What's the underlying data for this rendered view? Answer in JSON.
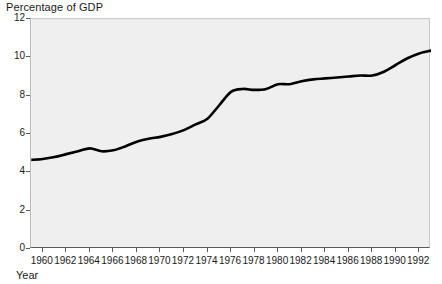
{
  "chart_data": {
    "type": "line",
    "title": "Percentage of GDP",
    "xlabel": "Year",
    "ylabel": "",
    "xlim": [
      1959,
      1993
    ],
    "ylim": [
      0,
      12
    ],
    "grid": false,
    "legend": "none",
    "y_ticks": [
      0,
      2,
      4,
      6,
      8,
      10,
      12
    ],
    "y_tick_labels": [
      "0",
      "2",
      "4",
      "6",
      "8",
      "10",
      "12"
    ],
    "x_ticks": [
      1960,
      1962,
      1964,
      1966,
      1968,
      1970,
      1972,
      1974,
      1976,
      1978,
      1980,
      1982,
      1984,
      1986,
      1988,
      1990,
      1992
    ],
    "x_tick_labels": [
      "1960",
      "1962",
      "1964",
      "1966",
      "1968",
      "1970",
      "1972",
      "1974",
      "1976",
      "1978",
      "1980",
      "1982",
      "1984",
      "1986",
      "1988",
      "1990",
      "1992"
    ],
    "line_color": "#000000",
    "line_width": 2.6,
    "plot_background": "#efefef",
    "series": [
      {
        "name": "Percentage of GDP",
        "x": [
          1959,
          1960,
          1961,
          1962,
          1963,
          1964,
          1965,
          1966,
          1967,
          1968,
          1969,
          1970,
          1971,
          1972,
          1973,
          1974,
          1975,
          1976,
          1977,
          1978,
          1979,
          1980,
          1981,
          1982,
          1983,
          1984,
          1985,
          1986,
          1987,
          1988,
          1989,
          1990,
          1991,
          1992,
          1993
        ],
        "values": [
          4.65,
          4.7,
          4.8,
          4.95,
          5.1,
          5.25,
          5.1,
          5.15,
          5.35,
          5.6,
          5.75,
          5.85,
          6.0,
          6.2,
          6.5,
          6.8,
          7.5,
          8.2,
          8.35,
          8.3,
          8.35,
          8.6,
          8.6,
          8.75,
          8.85,
          8.9,
          8.95,
          9.0,
          9.05,
          9.05,
          9.25,
          9.6,
          9.95,
          10.2,
          10.35
        ]
      }
    ]
  }
}
